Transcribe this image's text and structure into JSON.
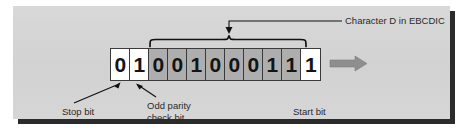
{
  "figure": {
    "panel_color": "#d5d5d5",
    "shadow_color": "#2b2b2b",
    "line_color": "#1a1a1a",
    "flow_arrow_color": "#8a8a8a"
  },
  "bit_stream": {
    "bits": [
      "0",
      "1",
      "0",
      "0",
      "1",
      "0",
      "0",
      "0",
      "1",
      "1",
      "1"
    ],
    "cell_fills": [
      "white",
      "white",
      "gray",
      "gray",
      "gray",
      "gray",
      "gray",
      "gray",
      "gray",
      "gray",
      "white"
    ]
  },
  "annotations": {
    "character": "Character D in EBCDIC",
    "stop_bit": "Stop bit",
    "odd_parity": "Odd parity check bit",
    "start_bit": "Start bit"
  },
  "chart_data": {
    "type": "table",
    "title": "Character D in EBCDIC",
    "categories": [
      "bit 1",
      "bit 2",
      "bit 3",
      "bit 4",
      "bit 5",
      "bit 6",
      "bit 7",
      "bit 8",
      "bit 9",
      "bit 10",
      "bit 11"
    ],
    "values": [
      0,
      1,
      0,
      0,
      1,
      0,
      0,
      0,
      1,
      1,
      1
    ],
    "annotations": [
      {
        "label": "Stop bit",
        "bits": [
          1
        ]
      },
      {
        "label": "Odd parity check bit",
        "bits": [
          2
        ]
      },
      {
        "label": "Character D in EBCDIC",
        "bits": [
          3,
          4,
          5,
          6,
          7,
          8,
          9,
          10
        ]
      },
      {
        "label": "Start bit",
        "bits": [
          11
        ]
      }
    ]
  }
}
